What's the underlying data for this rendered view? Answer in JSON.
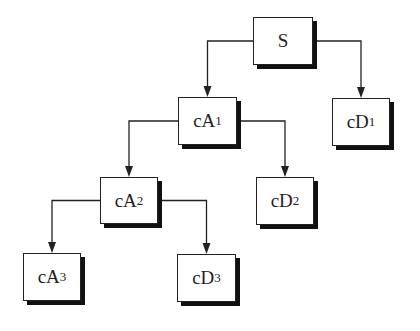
{
  "diagram": {
    "type": "wavelet-decomposition-tree",
    "nodes": [
      {
        "id": "S",
        "base": "S",
        "sub": "",
        "x": 253,
        "y": 17,
        "w": 60,
        "h": 48
      },
      {
        "id": "cA1",
        "base": "cA",
        "sub": "1",
        "x": 178,
        "y": 97,
        "w": 59,
        "h": 48
      },
      {
        "id": "cD1",
        "base": "cD",
        "sub": "1",
        "x": 332,
        "y": 98,
        "w": 58,
        "h": 48
      },
      {
        "id": "cA2",
        "base": "cA",
        "sub": "2",
        "x": 100,
        "y": 177,
        "w": 58,
        "h": 47
      },
      {
        "id": "cD2",
        "base": "cD",
        "sub": "2",
        "x": 256,
        "y": 177,
        "w": 58,
        "h": 48
      },
      {
        "id": "cA3",
        "base": "cA",
        "sub": "3",
        "x": 23,
        "y": 253,
        "w": 58,
        "h": 48
      },
      {
        "id": "cD3",
        "base": "cD",
        "sub": "3",
        "x": 177,
        "y": 254,
        "w": 59,
        "h": 48
      }
    ],
    "edges": [
      {
        "from": "S",
        "to": "cA1"
      },
      {
        "from": "S",
        "to": "cD1"
      },
      {
        "from": "cA1",
        "to": "cA2"
      },
      {
        "from": "cA1",
        "to": "cD2"
      },
      {
        "from": "cA2",
        "to": "cA3"
      },
      {
        "from": "cA2",
        "to": "cD3"
      }
    ],
    "colors": {
      "line": "#222222",
      "shadow": "#111111",
      "fill": "#ffffff"
    }
  }
}
